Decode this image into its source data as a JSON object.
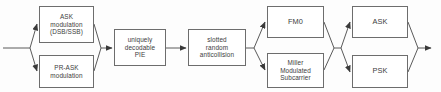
{
  "diagram": {
    "type": "block-flow-diagram",
    "colors": {
      "background": "#fdfdfd",
      "box_fill": "#ffffff",
      "box_border": "#6d6d6d",
      "connector": "#5a5a5a",
      "text": "#3c3c3c"
    },
    "nodes": [
      {
        "id": "ask-modulation",
        "label": "ASK\nmodulation\n(DSB/SSB)",
        "x": 39,
        "y": 6,
        "w": 55,
        "h": 37,
        "size": "sz-sm"
      },
      {
        "id": "pr-ask-modulation",
        "label": "PR-ASK\nmodulation",
        "x": 39,
        "y": 55,
        "w": 55,
        "h": 33,
        "size": "sz-sm"
      },
      {
        "id": "uniquely-decodable-pie",
        "label": "uniquely\ndecodable\nPIE",
        "x": 114,
        "y": 29,
        "w": 52,
        "h": 37,
        "size": "sz-sm"
      },
      {
        "id": "slotted-random-anticollision",
        "label": "slotted\nrandom\nanticollision",
        "x": 188,
        "y": 29,
        "w": 58,
        "h": 37,
        "size": "sz-sm"
      },
      {
        "id": "fm0",
        "label": "FM0",
        "x": 267,
        "y": 6,
        "w": 57,
        "h": 32,
        "size": "sz-lg"
      },
      {
        "id": "miller-modulated-subcarrier",
        "label": "Miller\nModulated\nSubcarrier",
        "x": 267,
        "y": 53,
        "w": 57,
        "h": 35,
        "size": "sz-sm"
      },
      {
        "id": "ask",
        "label": "ASK",
        "x": 352,
        "y": 6,
        "w": 56,
        "h": 32,
        "size": "sz-lg"
      },
      {
        "id": "psk",
        "label": "PSK",
        "x": 352,
        "y": 55,
        "w": 56,
        "h": 33,
        "size": "sz-lg"
      }
    ],
    "connectors": {
      "input_stub": "horizontal input line entering at left edge",
      "fan_out_1": "splits to ASK modulation and PR-ASK modulation",
      "fan_in_1": "merges into uniquely decodable PIE",
      "link_pie_to_anticollision": "straight horizontal link",
      "fan_out_2": "splits to FM0 and Miller Modulated Subcarrier",
      "fan_in_2": "merges then splits to ASK and PSK",
      "fan_in_3": "merges to output arrow at right edge"
    }
  }
}
